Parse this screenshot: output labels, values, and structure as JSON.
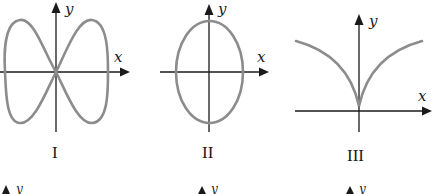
{
  "figure": {
    "graphs": [
      {
        "label": "I",
        "x_axis": "x",
        "y_axis": "y",
        "curve": "figure-eight (lemniscate-like) curve crossing at origin"
      },
      {
        "label": "II",
        "x_axis": "x",
        "y_axis": "y",
        "curve": "vertical ellipse centered at origin"
      },
      {
        "label": "III",
        "x_axis": "x",
        "y_axis": "y",
        "curve": "cusp at origin opening upward"
      }
    ],
    "partial_row": [
      {
        "y_axis": "y"
      },
      {
        "y_axis": "y"
      },
      {
        "y_axis": "y"
      }
    ]
  },
  "colors": {
    "axis": "#1a1a1a",
    "curve": "#8c8c8c"
  }
}
